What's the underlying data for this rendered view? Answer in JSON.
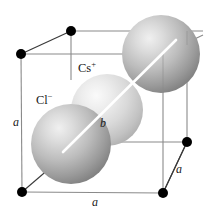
{
  "figure": {
    "background_color": "#ffffff",
    "edge_color": "#8a8a8a",
    "vertex_color": "#000000",
    "diagonal_color": "#ffffff",
    "labels": {
      "cation": "Cs",
      "cation_charge": "+",
      "anion": "Cl",
      "anion_charge": "−",
      "edge_left": "a",
      "edge_bottom": "a",
      "edge_right": "a",
      "body_diagonal": "b"
    },
    "spheres": [
      {
        "name": "chloride-sphere-top-right",
        "ion": "Cl",
        "cx": 161,
        "cy": 54,
        "r": 39,
        "light_color": "#e3e3e3",
        "mid_color": "#b4b4b4",
        "dark_color": "#7d7d7d"
      },
      {
        "name": "caesium-sphere-center",
        "ion": "Cs",
        "cx": 107,
        "cy": 110,
        "r": 36,
        "light_color": "#f2f2f2",
        "mid_color": "#d2d2d2",
        "dark_color": "#a8a8a8"
      },
      {
        "name": "chloride-sphere-bottom-left",
        "ion": "Cl",
        "cx": 71,
        "cy": 144,
        "r": 40,
        "light_color": "#e3e3e3",
        "mid_color": "#b4b4b4",
        "dark_color": "#7d7d7d"
      }
    ],
    "vertices": [
      {
        "name": "vertex-top-back-left",
        "x": 71,
        "y": 31,
        "r": 5.0,
        "visible": true
      },
      {
        "name": "vertex-top-front-left",
        "x": 21,
        "y": 54,
        "r": 5.0,
        "visible": true
      },
      {
        "name": "vertex-mid-back-right",
        "x": 187,
        "y": 142,
        "r": 5.0,
        "visible": true
      },
      {
        "name": "vertex-bottom-front-left",
        "x": 22,
        "y": 192,
        "r": 5.0,
        "visible": true
      },
      {
        "name": "vertex-bottom-front-right",
        "x": 163,
        "y": 193,
        "r": 5.0,
        "visible": true
      }
    ],
    "diagonal": {
      "x1": 63,
      "y1": 152,
      "x2": 176,
      "y2": 40
    }
  }
}
